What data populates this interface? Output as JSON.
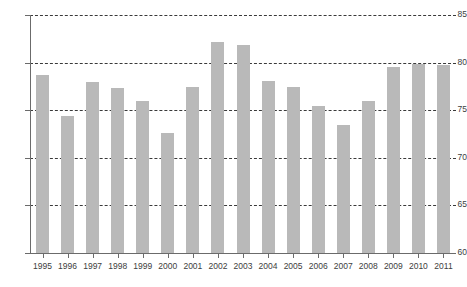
{
  "chart_data": {
    "type": "bar",
    "title": "",
    "subtitle": "",
    "xlabel": "",
    "ylabel": "",
    "ylim": [
      60,
      85
    ],
    "ytick_values": [
      60,
      65,
      70,
      75,
      80,
      85
    ],
    "ytick_labels": [
      "60",
      "65",
      "70",
      "75",
      "80",
      "85"
    ],
    "grid": true,
    "grid_axis": "y",
    "grid_style": "dashed",
    "legend": false,
    "legend_position": "none",
    "bar_color": "#b9b9b9",
    "axis_color": "#6b6b6b",
    "grid_color": "#3a3a3a",
    "categories": [
      "1995",
      "1996",
      "1997",
      "1998",
      "1999",
      "2000",
      "2001",
      "2002",
      "2003",
      "2004",
      "2005",
      "2006",
      "2007",
      "2008",
      "2009",
      "2010",
      "2011"
    ],
    "values": [
      78.7,
      74.4,
      78.0,
      77.3,
      76.0,
      72.6,
      77.4,
      82.2,
      81.9,
      78.1,
      77.4,
      75.4,
      73.4,
      76.0,
      79.5,
      79.9,
      79.7
    ],
    "series": [
      {
        "name": "",
        "values": [
          78.7,
          74.4,
          78.0,
          77.3,
          76.0,
          72.6,
          77.4,
          82.2,
          81.9,
          78.1,
          77.4,
          75.4,
          73.4,
          76.0,
          79.5,
          79.9,
          79.7
        ]
      }
    ]
  }
}
